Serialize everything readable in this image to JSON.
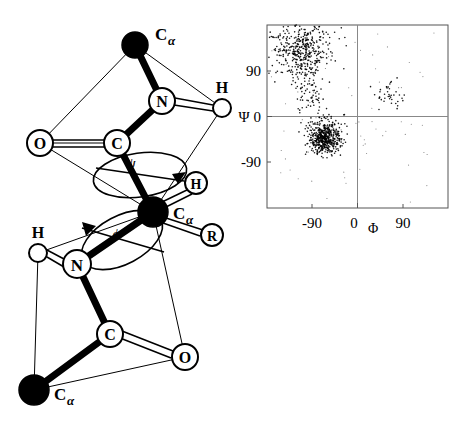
{
  "figure": {
    "panels": [
      "peptide-backbone-diagram",
      "ramachandran-plot"
    ]
  },
  "molecule": {
    "title": "Peptide backbone with phi and psi dihedral rotations",
    "angle_labels": {
      "psi": "ψ",
      "phi": "ϕ"
    },
    "atoms": [
      {
        "id": "ca-top",
        "label": "C",
        "sub": "α",
        "style": "filled",
        "x": 135,
        "y": 45,
        "r": 13,
        "label_dx": 20,
        "label_dy": -10
      },
      {
        "id": "n-top",
        "label": "N",
        "sub": "",
        "style": "open",
        "x": 162,
        "y": 101,
        "r": 13,
        "label_dx": 0,
        "label_dy": 0
      },
      {
        "id": "h-top",
        "label": "H",
        "sub": "",
        "style": "open",
        "x": 222,
        "y": 108,
        "r": 9,
        "label_dx": 0,
        "label_dy": -15
      },
      {
        "id": "c-top",
        "label": "C",
        "sub": "",
        "style": "open",
        "x": 117,
        "y": 143,
        "r": 13,
        "label_dx": 0,
        "label_dy": 0
      },
      {
        "id": "o-top",
        "label": "O",
        "sub": "",
        "style": "open",
        "x": 40,
        "y": 143,
        "r": 13,
        "label_dx": 0,
        "label_dy": 0
      },
      {
        "id": "ca-center",
        "label": "C",
        "sub": "α",
        "style": "filled",
        "x": 153,
        "y": 212,
        "r": 14,
        "label_dx": 22,
        "label_dy": 5
      },
      {
        "id": "h-center",
        "label": "H",
        "sub": "",
        "style": "open",
        "x": 196,
        "y": 183,
        "r": 11,
        "label_dx": 0,
        "label_dy": 0
      },
      {
        "id": "r-center",
        "label": "R",
        "sub": "",
        "style": "open",
        "x": 212,
        "y": 235,
        "r": 11,
        "label_dx": 0,
        "label_dy": 0
      },
      {
        "id": "n-bot",
        "label": "N",
        "sub": "",
        "style": "open",
        "x": 77,
        "y": 264,
        "r": 14,
        "label_dx": 0,
        "label_dy": 0
      },
      {
        "id": "h-bot",
        "label": "H",
        "sub": "",
        "style": "open",
        "x": 38,
        "y": 253,
        "r": 9,
        "label_dx": 0,
        "label_dy": -15
      },
      {
        "id": "c-bot",
        "label": "C",
        "sub": "",
        "style": "open",
        "x": 110,
        "y": 334,
        "r": 13,
        "label_dx": 0,
        "label_dy": 0
      },
      {
        "id": "o-bot",
        "label": "O",
        "sub": "",
        "style": "open",
        "x": 185,
        "y": 357,
        "r": 13,
        "label_dx": 0,
        "label_dy": 0
      },
      {
        "id": "ca-bot",
        "label": "C",
        "sub": "α",
        "style": "filled",
        "x": 34,
        "y": 390,
        "r": 14,
        "label_dx": 22,
        "label_dy": 10
      }
    ]
  },
  "chart_data": {
    "type": "scatter",
    "xlabel": "Φ",
    "ylabel": "Ψ",
    "xlim": [
      -180,
      180
    ],
    "ylim": [
      -180,
      180
    ],
    "xticks": [
      -90,
      0,
      90
    ],
    "xticklabels": [
      "-90",
      "0",
      "90"
    ],
    "yticks": [
      90,
      0,
      -90
    ],
    "yticklabels": [
      "90",
      "0",
      "-90"
    ],
    "grid": false,
    "axis_lines": {
      "x": 0,
      "y": 0
    },
    "marker": "dot",
    "marker_color": "#000000",
    "regions": [
      {
        "name": "beta-sheet",
        "center": [
          -110,
          130
        ],
        "spread": [
          30,
          28
        ],
        "count": 430
      },
      {
        "name": "polyproline-bridge",
        "center": [
          -95,
          40
        ],
        "spread": [
          18,
          35
        ],
        "count": 70
      },
      {
        "name": "alpha-helix",
        "center": [
          -65,
          -42
        ],
        "spread": [
          16,
          16
        ],
        "count": 520
      },
      {
        "name": "left-handed-helix",
        "center": [
          60,
          42
        ],
        "spread": [
          18,
          14
        ],
        "count": 40
      },
      {
        "name": "scatter-outliers",
        "center": [
          0,
          0
        ],
        "spread": [
          120,
          120
        ],
        "count": 90
      }
    ]
  }
}
